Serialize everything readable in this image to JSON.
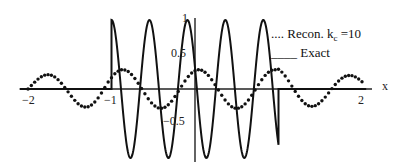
{
  "chart_data": {
    "type": "line",
    "title": "",
    "xlabel": "x",
    "ylabel": "",
    "xlim": [
      -2,
      2
    ],
    "ylim": [
      -1,
      1
    ],
    "grid": false,
    "legend_position": "upper right",
    "x_ticks": [
      "-2",
      "-1",
      "1",
      "2"
    ],
    "y_ticks": [
      "1",
      "0.5",
      "-0.5",
      "-1"
    ],
    "series": [
      {
        "name": "Recon. k_c=10",
        "style": "dotted",
        "description": "Band-limited reconstruction with small-amplitude oscillations (~0.3) extending over [-2,2]",
        "x": [
          -2.0,
          -1.8,
          -1.6,
          -1.4,
          -1.2,
          -1.0,
          -0.8,
          -0.6,
          -0.4,
          -0.2,
          0.0,
          0.2,
          0.4,
          0.6,
          0.8,
          1.0,
          1.2,
          1.4,
          1.6,
          1.8,
          2.0
        ],
        "values": [
          0.0,
          0.12,
          -0.2,
          0.0,
          0.28,
          0.0,
          -0.3,
          0.0,
          0.22,
          0.0,
          0.0,
          0.22,
          0.0,
          0.25,
          0.0,
          -0.3,
          0.0,
          0.2,
          0.0,
          -0.15,
          0.0
        ]
      },
      {
        "name": "Exact",
        "style": "solid",
        "description": "Unit-amplitude oscillation supported on [-1,1], zero elsewhere, with jumps at x=-1 and x=1",
        "x": [
          -2.0,
          -1.0,
          -0.83,
          -0.67,
          -0.5,
          -0.33,
          -0.17,
          0.0,
          0.17,
          0.33,
          0.5,
          0.67,
          0.83,
          1.0,
          2.0
        ],
        "values": [
          0.0,
          1.0,
          -1.0,
          1.0,
          -1.0,
          1.0,
          -1.0,
          0.0,
          1.0,
          -1.0,
          1.0,
          -1.0,
          1.0,
          -1.0,
          0.0
        ]
      }
    ]
  },
  "labels": {
    "x_axis": "x",
    "tick_x_neg2": "−2",
    "tick_x_neg1": "−1",
    "tick_x_2": "2",
    "tick_y_1": "1",
    "tick_y_05": "0.5",
    "tick_y_neg05": "−0.5",
    "tick_y_neg1": "−1",
    "legend_recon_prefix": ".... Recon. k",
    "legend_recon_sub": "c",
    "legend_recon_suffix": " =10",
    "legend_exact_prefix": "____",
    "legend_exact": " Exact"
  }
}
